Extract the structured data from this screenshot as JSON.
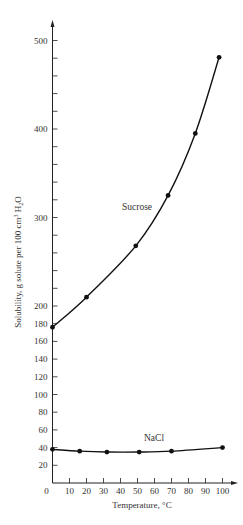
{
  "chart_data": {
    "type": "line",
    "title": "",
    "xlabel": "Temperature, °C",
    "ylabel": "Solubility,  g solute per 100 cm³ H₂O",
    "xlim": [
      0,
      100
    ],
    "ylim": [
      0,
      500
    ],
    "x_ticks": [
      0,
      10,
      20,
      30,
      40,
      50,
      60,
      70,
      80,
      90,
      100
    ],
    "x_tick_labels": [
      "0",
      "10",
      "20",
      "30",
      "40",
      "50",
      "60",
      "70",
      "80",
      "90",
      "100"
    ],
    "y_ticks_labeled": [
      20,
      40,
      60,
      80,
      100,
      120,
      140,
      160,
      180,
      200,
      300,
      400,
      500
    ],
    "y_tick_labels": [
      "20",
      "40",
      "60",
      "80",
      "100",
      "120",
      "140",
      "160",
      "180",
      "200",
      "300",
      "400",
      "500"
    ],
    "y_ticks_minor": [
      220,
      240,
      260,
      280,
      320,
      340,
      360,
      380,
      420,
      440,
      460,
      480
    ],
    "grid": false,
    "legend": "inline labels on curves",
    "series": [
      {
        "name": "Sucrose",
        "x": [
          0,
          20,
          49,
          68,
          84,
          98
        ],
        "y": [
          176,
          210,
          268,
          325,
          395,
          481
        ],
        "marker": "circle",
        "smooth": true
      },
      {
        "name": "NaCl",
        "x": [
          0,
          16,
          32,
          51,
          70,
          100
        ],
        "y": [
          38,
          36,
          35,
          35,
          36,
          40
        ],
        "marker": "circle",
        "smooth": true
      }
    ]
  },
  "labels": {
    "sucrose": "Sucrose",
    "nacl": "NaCl",
    "xlabel": "Temperature, °C",
    "ylabel_main": "Solubility,  g solute per 100 cm",
    "ylabel_sup": "3",
    "ylabel_h": " H",
    "ylabel_sub": "2",
    "ylabel_o": "O"
  },
  "colors": {
    "line": "#111111",
    "text": "#333333",
    "axis": "#222222",
    "background": "#ffffff"
  }
}
